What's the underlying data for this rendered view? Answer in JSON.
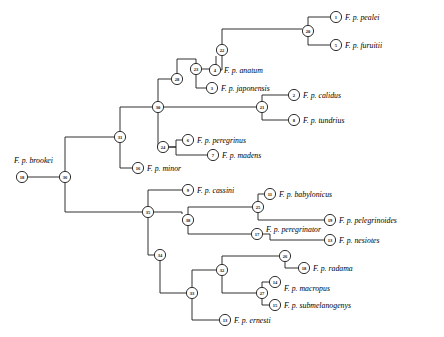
{
  "figure": {
    "type": "phylogenetic-cladogram",
    "orientation": "left-to-right",
    "background": "#ffffff",
    "line_color": "#1a1a1a",
    "node_shape": "circle"
  },
  "taxa": [
    {
      "id": "brookei",
      "node": "18",
      "label": "F. p. brookei",
      "node_x": 22,
      "node_y": 177,
      "label_x": 14,
      "label_y": 160,
      "label_anchor": "start"
    },
    {
      "id": "pealei",
      "node": "1",
      "label": "F. p. pealei",
      "node_x": 336,
      "node_y": 17,
      "label_x": 345,
      "label_y": 17,
      "label_anchor": "start"
    },
    {
      "id": "furuitii",
      "node": "5",
      "label": "F. p. furuitii",
      "node_x": 336,
      "node_y": 45,
      "label_x": 345,
      "label_y": 45,
      "label_anchor": "start"
    },
    {
      "id": "anatum",
      "node": "4",
      "label": "F. p. anatum",
      "node_x": 215,
      "node_y": 70,
      "label_x": 224,
      "label_y": 70,
      "label_anchor": "start"
    },
    {
      "id": "japonensis",
      "node": "3",
      "label": "F. p. japonensis",
      "node_x": 212,
      "node_y": 88,
      "label_x": 221,
      "label_y": 88,
      "label_anchor": "start"
    },
    {
      "id": "calidus",
      "node": "2",
      "label": "F. p. calidus",
      "node_x": 294,
      "node_y": 95,
      "label_x": 303,
      "label_y": 95,
      "label_anchor": "start"
    },
    {
      "id": "tundrius",
      "node": "8",
      "label": "F. p. tundrius",
      "node_x": 294,
      "node_y": 120,
      "label_x": 303,
      "label_y": 120,
      "label_anchor": "start"
    },
    {
      "id": "peregrinus",
      "node": "6",
      "label": "F. p. peregrinus",
      "node_x": 188,
      "node_y": 140,
      "label_x": 197,
      "label_y": 140,
      "label_anchor": "start"
    },
    {
      "id": "madens",
      "node": "7",
      "label": "F. p. madens",
      "node_x": 213,
      "node_y": 155,
      "label_x": 222,
      "label_y": 155,
      "label_anchor": "start"
    },
    {
      "id": "minor",
      "node": "16",
      "label": "F. p. minor",
      "node_x": 138,
      "node_y": 168,
      "label_x": 147,
      "label_y": 168,
      "label_anchor": "start"
    },
    {
      "id": "cassini",
      "node": "9",
      "label": "F. p. cassini",
      "node_x": 188,
      "node_y": 190,
      "label_x": 197,
      "label_y": 190,
      "label_anchor": "start"
    },
    {
      "id": "babylonicus",
      "node": "11",
      "label": "F. p. babylonicus",
      "node_x": 270,
      "node_y": 194,
      "label_x": 279,
      "label_y": 194,
      "label_anchor": "start"
    },
    {
      "id": "pelegrinoides",
      "node": "19",
      "label": "F. p. pelegrinoides",
      "node_x": 330,
      "node_y": 220,
      "label_x": 339,
      "label_y": 220,
      "label_anchor": "start"
    },
    {
      "id": "peregrinator",
      "node": "17",
      "label": "F. p. peregrinator",
      "node_x": 257,
      "node_y": 234,
      "label_x": 266,
      "label_y": 229,
      "label_anchor": "start"
    },
    {
      "id": "nesiotes",
      "node": "13",
      "label": "F. p. nesiotes",
      "node_x": 330,
      "node_y": 240,
      "label_x": 339,
      "label_y": 240,
      "label_anchor": "start"
    },
    {
      "id": "radama",
      "node": "18",
      "label": "F. p. radama",
      "node_x": 304,
      "node_y": 268,
      "label_x": 313,
      "label_y": 268,
      "label_anchor": "start"
    },
    {
      "id": "macropus",
      "node": "14",
      "label": "F. p. macropus",
      "node_x": 275,
      "node_y": 282,
      "label_x": 284,
      "label_y": 288,
      "label_anchor": "start"
    },
    {
      "id": "submelanogenys",
      "node": "15",
      "label": "F. p. submelanogenys",
      "node_x": 275,
      "node_y": 305,
      "label_x": 284,
      "label_y": 305,
      "label_anchor": "start"
    },
    {
      "id": "ernesti",
      "node": "13",
      "label": "F. p. ernesti",
      "node_x": 225,
      "node_y": 320,
      "label_x": 234,
      "label_y": 320,
      "label_anchor": "start"
    }
  ],
  "internal_nodes": [
    {
      "node": "20",
      "x": 308,
      "y": 31
    },
    {
      "node": "22",
      "x": 222,
      "y": 50
    },
    {
      "node": "23",
      "x": 196,
      "y": 69
    },
    {
      "node": "28",
      "x": 177,
      "y": 79
    },
    {
      "node": "21",
      "x": 262,
      "y": 107
    },
    {
      "node": "30",
      "x": 158,
      "y": 107
    },
    {
      "node": "31",
      "x": 120,
      "y": 137
    },
    {
      "node": "24",
      "x": 163,
      "y": 147
    },
    {
      "node": "36",
      "x": 65,
      "y": 177
    },
    {
      "node": "35",
      "x": 148,
      "y": 212
    },
    {
      "node": "25",
      "x": 258,
      "y": 207
    },
    {
      "node": "38",
      "x": 188,
      "y": 220
    },
    {
      "node": "26",
      "x": 285,
      "y": 256
    },
    {
      "node": "34",
      "x": 160,
      "y": 255
    },
    {
      "node": "32",
      "x": 222,
      "y": 270
    },
    {
      "node": "27",
      "x": 262,
      "y": 293
    },
    {
      "node": "33",
      "x": 192,
      "y": 293
    }
  ],
  "edges": [
    {
      "from": "36",
      "to": "18-brookei",
      "type": "horizontal"
    },
    {
      "from": "36",
      "to": "31",
      "type": "elbow"
    },
    {
      "from": "36",
      "to": "35",
      "type": "elbow"
    },
    {
      "from": "31",
      "to": "30",
      "type": "elbow"
    },
    {
      "from": "31",
      "to": "16",
      "type": "elbow"
    },
    {
      "from": "30",
      "to": "28",
      "type": "elbow"
    },
    {
      "from": "30",
      "to": "21",
      "type": "elbow"
    },
    {
      "from": "30",
      "to": "24",
      "type": "elbow"
    },
    {
      "from": "28",
      "to": "23",
      "type": "elbow"
    },
    {
      "from": "23",
      "to": "22",
      "type": "elbow"
    },
    {
      "from": "23",
      "to": "3",
      "type": "elbow"
    },
    {
      "from": "22",
      "to": "20",
      "type": "elbow"
    },
    {
      "from": "22",
      "to": "4",
      "type": "elbow"
    },
    {
      "from": "20",
      "to": "1",
      "type": "elbow"
    },
    {
      "from": "20",
      "to": "5",
      "type": "elbow"
    },
    {
      "from": "21",
      "to": "2",
      "type": "elbow"
    },
    {
      "from": "21",
      "to": "8",
      "type": "elbow"
    },
    {
      "from": "24",
      "to": "6",
      "type": "elbow"
    },
    {
      "from": "24",
      "to": "7",
      "type": "elbow"
    },
    {
      "from": "35",
      "to": "9",
      "type": "elbow"
    },
    {
      "from": "35",
      "to": "38",
      "type": "elbow"
    },
    {
      "from": "35",
      "to": "34",
      "type": "elbow"
    },
    {
      "from": "38",
      "to": "25",
      "type": "elbow"
    },
    {
      "from": "38",
      "to": "17",
      "type": "elbow"
    },
    {
      "from": "25",
      "to": "11",
      "type": "elbow"
    },
    {
      "from": "25",
      "to": "19",
      "type": "elbow"
    },
    {
      "from": "17",
      "to": "13-nesiotes",
      "type": "elbow"
    },
    {
      "from": "34",
      "to": "33",
      "type": "elbow"
    },
    {
      "from": "33",
      "to": "32",
      "type": "elbow"
    },
    {
      "from": "33",
      "to": "13-ernesti",
      "type": "elbow"
    },
    {
      "from": "32",
      "to": "26",
      "type": "elbow"
    },
    {
      "from": "32",
      "to": "27",
      "type": "elbow"
    },
    {
      "from": "26",
      "to": "18-radama",
      "type": "elbow"
    },
    {
      "from": "27",
      "to": "14",
      "type": "elbow"
    },
    {
      "from": "27",
      "to": "15",
      "type": "elbow"
    }
  ]
}
